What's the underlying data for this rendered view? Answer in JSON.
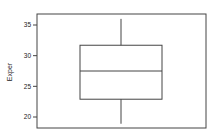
{
  "chart_data": {
    "type": "boxplot",
    "title": "",
    "xlabel": "",
    "ylabel": "Exper",
    "ylim": [
      18.3,
      37.0
    ],
    "yticks": [
      20,
      25,
      30,
      35
    ],
    "ytick_labels": [
      "20",
      "25",
      "30",
      "35"
    ],
    "grid": false,
    "legend": null,
    "series": [
      {
        "name": "Exper",
        "whisker_low": 18.9,
        "q1": 22.9,
        "median": 27.5,
        "q3": 31.7,
        "whisker_high": 36.0
      }
    ]
  },
  "colors": {
    "line": "#444444",
    "background": "#ffffff"
  }
}
